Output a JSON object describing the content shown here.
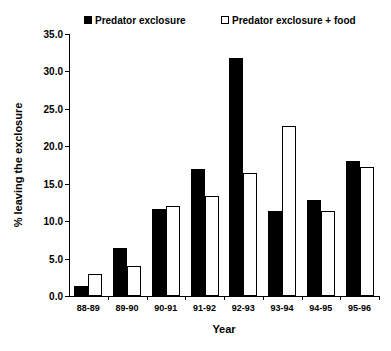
{
  "chart_data": {
    "type": "bar",
    "title": "",
    "xlabel": "Year",
    "ylabel": "% leaving the exclosure",
    "categories": [
      "88-89",
      "89-90",
      "90-91",
      "91-92",
      "92-93",
      "93-94",
      "94-95",
      "95-96"
    ],
    "ylim": [
      0.0,
      35.0
    ],
    "ytick_step": 5.0,
    "ytick_labels": [
      "0.0",
      "5.0",
      "10.0",
      "15.0",
      "20.0",
      "25.0",
      "30.0",
      "35.0"
    ],
    "ytick_values": [
      0.0,
      5.0,
      10.0,
      15.0,
      20.0,
      25.0,
      30.0,
      35.0
    ],
    "grid": false,
    "legend_position": "top",
    "series": [
      {
        "name": "Predator exclosure",
        "color": "#000000",
        "fill": "solid",
        "values": [
          1.3,
          6.4,
          11.6,
          17.0,
          31.8,
          11.3,
          12.8,
          18.0
        ]
      },
      {
        "name": "Predator exclosure + food",
        "color": "#ffffff",
        "fill": "hollow",
        "values": [
          2.9,
          4.0,
          12.0,
          13.4,
          16.4,
          22.7,
          11.4,
          17.3
        ]
      }
    ]
  },
  "legend": {
    "items": [
      {
        "label": "Predator exclosure",
        "swatch": "filled-square-marker"
      },
      {
        "label": "Predator exclosure + food",
        "swatch": "hollow-square-marker"
      }
    ]
  },
  "axes": {
    "x_title": "Year",
    "y_title": "% leaving the exclosure"
  }
}
